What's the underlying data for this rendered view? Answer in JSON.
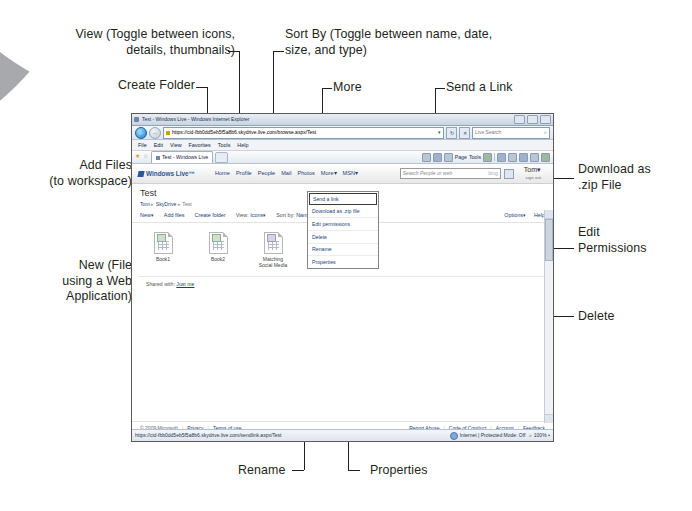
{
  "annotations": {
    "view": "View (Toggle between icons,\ndetails, thumbnails)",
    "create_folder": "Create Folder",
    "sort_by": "Sort By (Toggle between name, date,\nsize, and type)",
    "more": "More",
    "send_a_link": "Send a Link",
    "add_files": "Add Files\n(to workspace)",
    "new_file": "New (File\nusing a Web\nApplication)",
    "download_zip": "Download as\n.zip File",
    "edit_permissions": "Edit\nPermissions",
    "delete": "Delete",
    "rename": "Rename",
    "properties": "Properties"
  },
  "browser": {
    "title": "Test - Windows Live - Windows Internet Explorer",
    "address_url": "https://cid-fbb0dd5eb5f5a8b6.skydrive.live.com/browse.aspx/Test",
    "address_caret": "▾",
    "search_placeholder": "Live Search",
    "search_icon": "⌕",
    "refresh_icon": "↻",
    "stop_icon": "✕",
    "back_icon": "←",
    "forward_icon": "→",
    "menu_items": [
      "File",
      "Edit",
      "View",
      "Favorites",
      "Tools",
      "Help"
    ],
    "tab_label": "Test - Windows Live",
    "command_items": [
      "Page",
      "Tools"
    ],
    "status_url": "https://cid-fbb0dd5eb5f5a8b6.skydrive.live.com/sendlink.aspx/Test",
    "status_zone": "Internet | Protected Mode: Off",
    "status_zoom": "100%"
  },
  "page": {
    "brand": "Windows Live™",
    "nav": [
      "Home",
      "Profile",
      "People",
      "Mail",
      "Photos",
      "More▾",
      "MSN▾"
    ],
    "search_placeholder": "Search People or web",
    "search_brand": "bing",
    "user_name": "Tom▾",
    "sign_out": "sign out",
    "title": "Test",
    "breadcrumb": [
      "Tom",
      "SkyDrive",
      "Test"
    ],
    "breadcrumb_sep": "▸",
    "toolbar": {
      "new": "New▾",
      "add_files": "Add files",
      "create_folder": "Create folder",
      "view_label": "View:",
      "view_value": "Icons▾",
      "sort_label": "Sort by:",
      "sort_value": "Name▾",
      "more": "More▾",
      "options": "Options▾",
      "help": "Help"
    },
    "files": [
      {
        "name": "Book1",
        "kind": "xl"
      },
      {
        "name": "Book2",
        "kind": "xl"
      },
      {
        "name": "Matching\nSocial Media",
        "kind": "nt"
      },
      {
        "name": "test",
        "kind": "xl"
      }
    ],
    "shared_with_label": "Shared with:",
    "shared_with_value": "Just me",
    "footer_left": [
      "© 2009 Microsoft",
      "Privacy",
      "Terms of use"
    ],
    "footer_right": [
      "Report Abuse",
      "Code of Conduct",
      "Account",
      "Feedback"
    ]
  },
  "more_menu": [
    "Send a link",
    "Download as .zip file",
    "Edit permissions",
    "Delete",
    "Rename",
    "Properties"
  ],
  "colors": {
    "ink": "#231f20",
    "swoosh": "#a7a9ac",
    "link": "#1c3f77",
    "brand": "#2b5797"
  }
}
